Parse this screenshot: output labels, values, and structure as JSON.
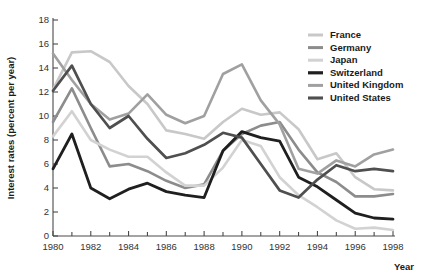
{
  "chart_data": {
    "type": "line",
    "title": "",
    "xlabel": "Year",
    "ylabel": "Interest rates (percent per year)",
    "xlim": [
      1980,
      1998
    ],
    "ylim": [
      0,
      18
    ],
    "grid": false,
    "legend_position": "top-right",
    "x": [
      1980,
      1981,
      1982,
      1983,
      1984,
      1985,
      1986,
      1987,
      1988,
      1989,
      1990,
      1991,
      1992,
      1993,
      1994,
      1995,
      1996,
      1997,
      1998
    ],
    "xticks": [
      1980,
      1982,
      1984,
      1986,
      1988,
      1990,
      1992,
      1994,
      1996,
      1998
    ],
    "xtick_labels": [
      "1980",
      "1982",
      "1984",
      "1986",
      "1988",
      "1990",
      "1992",
      "1994",
      "1996",
      "1998"
    ],
    "xticks_minor": [
      1981,
      1983,
      1985,
      1987,
      1989,
      1991,
      1993,
      1995,
      1997
    ],
    "yticks": [
      0,
      2,
      4,
      6,
      8,
      10,
      12,
      14,
      16,
      18
    ],
    "ytick_labels": [
      "0",
      "2",
      "4",
      "6",
      "8",
      "10",
      "12",
      "14",
      "16",
      "18"
    ],
    "series": [
      {
        "name": "France",
        "color": "#c8c8c8",
        "width": 2.6,
        "values": [
          12.2,
          15.3,
          15.4,
          14.5,
          12.5,
          11.0,
          8.8,
          8.5,
          8.1,
          9.5,
          10.6,
          10.1,
          10.3,
          8.9,
          6.4,
          6.9,
          4.9,
          3.9,
          3.8
        ]
      },
      {
        "name": "Germany",
        "color": "#8c8c8c",
        "width": 2.6,
        "values": [
          9.5,
          12.3,
          9.0,
          5.8,
          6.0,
          5.4,
          4.6,
          4.0,
          4.3,
          7.1,
          8.5,
          9.2,
          9.5,
          7.2,
          5.3,
          4.5,
          3.3,
          3.3,
          3.5
        ]
      },
      {
        "name": "Japan",
        "color": "#d2d2d2",
        "width": 2.6,
        "values": [
          8.3,
          10.4,
          8.0,
          7.2,
          6.6,
          6.6,
          5.3,
          4.2,
          4.2,
          5.7,
          8.0,
          7.5,
          4.9,
          3.4,
          2.4,
          1.3,
          0.6,
          0.7,
          0.5
        ]
      },
      {
        "name": "Switzerland",
        "color": "#1f1f1f",
        "width": 2.8,
        "values": [
          5.6,
          8.5,
          4.0,
          3.1,
          3.9,
          4.4,
          3.7,
          3.4,
          3.2,
          7.1,
          8.7,
          8.2,
          7.9,
          4.9,
          4.1,
          3.0,
          1.9,
          1.5,
          1.4
        ]
      },
      {
        "name": "United Kingdom",
        "color": "#a0a0a0",
        "width": 2.6,
        "values": [
          15.2,
          13.0,
          11.0,
          9.7,
          10.2,
          11.8,
          10.1,
          9.4,
          10.0,
          13.5,
          14.3,
          11.3,
          9.3,
          5.6,
          5.2,
          6.3,
          5.8,
          6.8,
          7.2
        ]
      },
      {
        "name": "United States",
        "color": "#4f4f4f",
        "width": 2.7,
        "values": [
          12.1,
          14.2,
          11.0,
          9.0,
          10.0,
          8.1,
          6.5,
          6.9,
          7.6,
          8.6,
          8.2,
          6.0,
          3.8,
          3.2,
          4.7,
          5.9,
          5.4,
          5.6,
          5.4
        ]
      }
    ]
  },
  "legend": {
    "items": [
      {
        "label": "France"
      },
      {
        "label": "Germany"
      },
      {
        "label": "Japan"
      },
      {
        "label": "Switzerland"
      },
      {
        "label": "United Kingdom"
      },
      {
        "label": "United States"
      }
    ]
  }
}
